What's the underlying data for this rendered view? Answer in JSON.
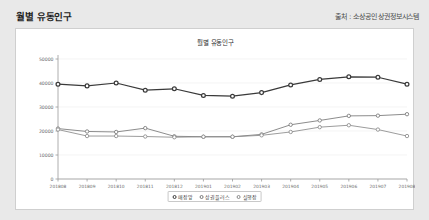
{
  "header": {
    "title": "월별 유동인구",
    "source": "출처 : 소상공인 상권정보시스템"
  },
  "card": {
    "chart_title": "월별 유동인구"
  },
  "chart_data": {
    "type": "line",
    "title": "월별 유동인구",
    "xlabel": "",
    "ylabel": "",
    "ylim": [
      0,
      50000
    ],
    "yticks": [
      0,
      10000,
      20000,
      30000,
      40000,
      50000
    ],
    "ytick_labels": [
      "0",
      "10000",
      "20000",
      "30000",
      "40000",
      "50000"
    ],
    "grid": true,
    "legend_position": "bottom-center",
    "categories": [
      "201808",
      "201809",
      "201810",
      "201811",
      "201812",
      "201901",
      "201902",
      "201903",
      "201904",
      "201905",
      "201906",
      "201907",
      "201908"
    ],
    "series": [
      {
        "name": "매장앞",
        "color": "#3a3a3a",
        "values": [
          39500,
          38800,
          40000,
          37000,
          37600,
          34800,
          34500,
          36000,
          39200,
          41500,
          42600,
          42400,
          39500
        ]
      },
      {
        "name": "상권플러스",
        "color": "#777777",
        "values": [
          21000,
          19800,
          19600,
          21200,
          17800,
          17600,
          17600,
          18600,
          22600,
          24400,
          26300,
          26400,
          27000
        ]
      },
      {
        "name": "실행장",
        "color": "#8a8a8a",
        "values": [
          20600,
          17900,
          17900,
          17700,
          17400,
          17600,
          17600,
          18200,
          19600,
          21600,
          22400,
          20600,
          17900
        ]
      }
    ]
  },
  "legend": {
    "items": [
      {
        "label": "매장앞"
      },
      {
        "label": "상권플러스"
      },
      {
        "label": "실행장"
      }
    ]
  }
}
